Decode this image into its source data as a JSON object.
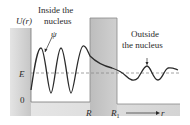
{
  "labels": {
    "y_axis": "U(r)",
    "psi": "ψ",
    "inside_line1": "Inside the",
    "inside_line2": "nucleus",
    "outside_line1": "Outside",
    "outside_line2": "the nucleus",
    "energy": "E",
    "zero": "0",
    "R": "R",
    "R1": "R",
    "R1_sub": "1",
    "r_axis": "r"
  },
  "colors": {
    "barrier_fill": "#c9c9c9",
    "floor_fill": "#d6d6d6",
    "curve": "#2b2b2b",
    "dashed": "#8a8a8a",
    "background": "#ffffff"
  }
}
